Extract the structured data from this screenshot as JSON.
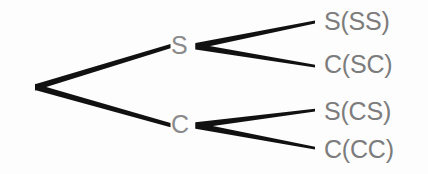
{
  "diagram": {
    "type": "probability-tree",
    "background_color": "#fdfdfd",
    "edge_color": "#111111",
    "node_text_color": "#8a8a8a",
    "leaf_text_color": "#7c7c7c",
    "root": {
      "name": "root",
      "x": 35,
      "y": 87
    },
    "level1": [
      {
        "id": "node-s",
        "label": "S",
        "letter_x": 171,
        "letter_y": 33,
        "vertex_x": 196,
        "vertex_y": 46
      },
      {
        "id": "node-c",
        "label": "C",
        "letter_x": 171,
        "letter_y": 112,
        "vertex_x": 196,
        "vertex_y": 125
      }
    ],
    "leaves": [
      {
        "id": "leaf-ss",
        "label": "S(SS)",
        "parent": "node-s",
        "edge_end_x": 315,
        "edge_end_y": 22,
        "text_x": 324,
        "text_y": 9
      },
      {
        "id": "leaf-sc",
        "label": "C(SC)",
        "parent": "node-s",
        "edge_end_x": 315,
        "edge_end_y": 66,
        "text_x": 324,
        "text_y": 52
      },
      {
        "id": "leaf-cs",
        "label": "S(CS)",
        "parent": "node-c",
        "edge_end_x": 315,
        "edge_end_y": 110,
        "text_x": 324,
        "text_y": 99
      },
      {
        "id": "leaf-cc",
        "label": "C(CC)",
        "parent": "node-c",
        "edge_end_x": 315,
        "edge_end_y": 148,
        "text_x": 324,
        "text_y": 137
      }
    ],
    "edges": [
      {
        "id": "edge-root-s",
        "from": "root",
        "to": "node-s"
      },
      {
        "id": "edge-root-c",
        "from": "root",
        "to": "node-c"
      },
      {
        "id": "edge-s-ss",
        "from": "node-s",
        "to": "leaf-ss"
      },
      {
        "id": "edge-s-sc",
        "from": "node-s",
        "to": "leaf-sc"
      },
      {
        "id": "edge-c-cs",
        "from": "node-c",
        "to": "leaf-cs"
      },
      {
        "id": "edge-c-cc",
        "from": "node-c",
        "to": "leaf-cc"
      }
    ]
  }
}
